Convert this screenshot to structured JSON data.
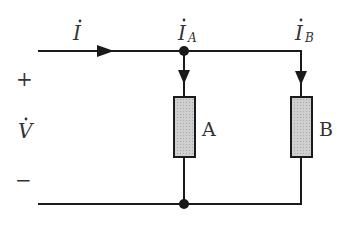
{
  "diagram": {
    "type": "parallel-circuit",
    "labels": {
      "total_current": "I",
      "current_a_main": "I",
      "current_a_sub": "A",
      "current_b_main": "I",
      "current_b_sub": "B",
      "plus": "+",
      "voltage": "V",
      "minus": "−",
      "element_a": "A",
      "element_b": "B"
    },
    "colors": {
      "wire": "#1a1a1a",
      "element_fill": "#c8c8c8",
      "text": "#333333"
    }
  }
}
